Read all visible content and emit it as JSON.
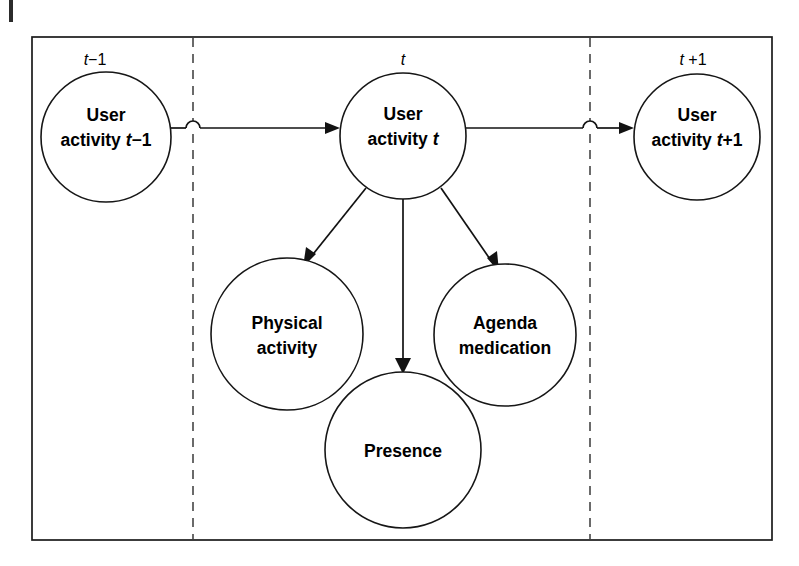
{
  "figure": {
    "kind": "dynamic-bayesian-network",
    "caption": "",
    "background_color": "#ffffff",
    "frame": {
      "x": 32,
      "y": 37,
      "width": 740,
      "height": 503,
      "stroke_color": "#1a1a1a"
    },
    "margin_tick": {
      "x": 9,
      "y": 0,
      "width": 4,
      "height": 22,
      "color": "#2b2b2b"
    }
  },
  "time_slices": [
    {
      "id": "slice-prev",
      "label_plain": "t-1",
      "label_italic": "t",
      "label_rest": "−1",
      "label_space": "",
      "x": 95,
      "y": 60
    },
    {
      "id": "slice-current",
      "label_plain": "t",
      "label_italic": "t",
      "label_rest": "",
      "label_space": "",
      "x": 403,
      "y": 60
    },
    {
      "id": "slice-next",
      "label_plain": "t +1",
      "label_italic": "t",
      "label_rest": "+1",
      "label_space": " ",
      "x": 693,
      "y": 60
    }
  ],
  "dividers": [
    {
      "id": "divider-left",
      "x": 193,
      "y1": 38,
      "y2": 539,
      "color": "#3a3a3a"
    },
    {
      "id": "divider-right",
      "x": 590,
      "y1": 38,
      "y2": 539,
      "color": "#3a3a3a"
    }
  ],
  "nodes": [
    {
      "id": "user-activity-prev",
      "line1": "User",
      "line2_pre": "activity ",
      "line2_italic": "t",
      "line2_post": "−1",
      "cx": 106,
      "cy": 137,
      "r": 65
    },
    {
      "id": "user-activity-current",
      "line1": "User",
      "line2_pre": "activity ",
      "line2_italic": "t",
      "line2_post": "",
      "cx": 403,
      "cy": 136,
      "r": 63
    },
    {
      "id": "user-activity-next",
      "line1": "User",
      "line2_pre": "activity ",
      "line2_italic": "t",
      "line2_post": "+1",
      "cx": 697,
      "cy": 137,
      "r": 63
    },
    {
      "id": "physical-activity",
      "line1": "Physical",
      "line2_pre": "activity",
      "line2_italic": "",
      "line2_post": "",
      "cx": 287,
      "cy": 334,
      "r": 76
    },
    {
      "id": "agenda-medication",
      "line1": "Agenda",
      "line2_pre": "medication",
      "line2_italic": "",
      "line2_post": "",
      "cx": 505,
      "cy": 335,
      "r": 71
    },
    {
      "id": "presence",
      "line1": "Presence",
      "line2_pre": "",
      "line2_italic": "",
      "line2_post": "",
      "cx": 403,
      "cy": 450,
      "r": 78
    }
  ],
  "edges": [
    {
      "id": "edge-prev-to-current",
      "from": "user-activity-prev",
      "to": "user-activity-current",
      "type": "horizontal-with-hop",
      "x1": 171,
      "x2": 334,
      "y": 128,
      "hop_x": 193,
      "hop_r": 7
    },
    {
      "id": "edge-current-to-next",
      "from": "user-activity-current",
      "to": "user-activity-next",
      "type": "horizontal-with-hop",
      "x1": 466,
      "x2": 628,
      "y": 128,
      "hop_x": 590,
      "hop_r": 7
    },
    {
      "id": "edge-current-to-physical",
      "from": "user-activity-current",
      "to": "physical-activity",
      "type": "diagonal",
      "x1": 363,
      "y1": 186,
      "x2": 308,
      "y2": 260
    },
    {
      "id": "edge-current-to-presence",
      "from": "user-activity-current",
      "to": "presence",
      "type": "vertical",
      "x1": 403,
      "y1": 199,
      "x2": 403,
      "y2": 371
    },
    {
      "id": "edge-current-to-agenda",
      "from": "user-activity-current",
      "to": "agenda-medication",
      "type": "diagonal",
      "x1": 444,
      "y1": 186,
      "x2": 490,
      "y2": 266
    }
  ],
  "colors": {
    "stroke": "#121212",
    "frame": "#1a1a1a",
    "divider": "#3a3a3a",
    "node_fill": "#ffffff",
    "text": "#000000",
    "background": "#ffffff"
  }
}
